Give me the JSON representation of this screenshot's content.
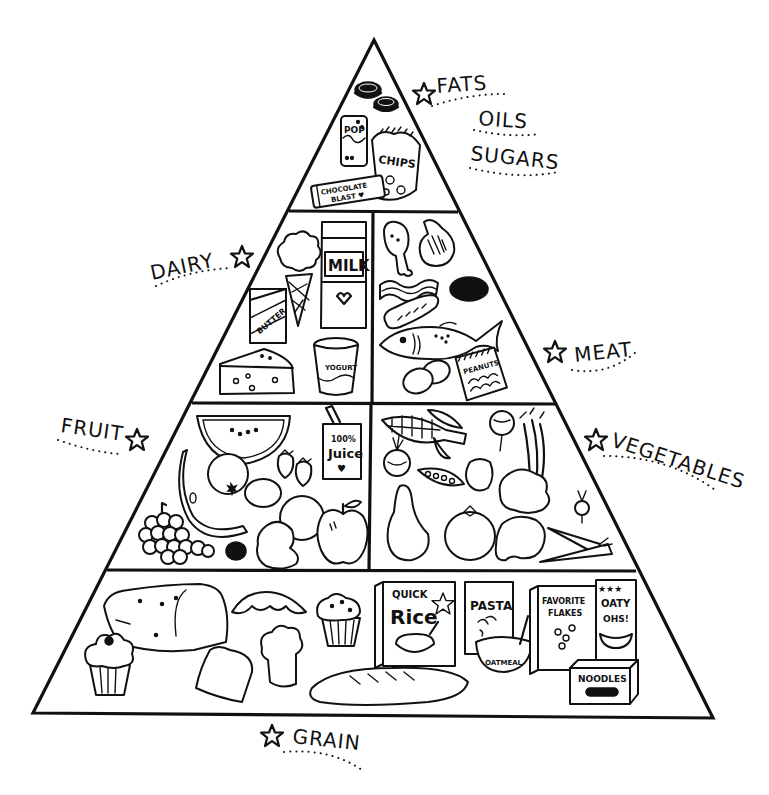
{
  "diagram": {
    "type": "food-pyramid",
    "style": "black-and-white line drawing",
    "colors": {
      "ink": "#111111",
      "background": "#ffffff"
    },
    "tiers": [
      {
        "level": 1,
        "label": "FATS, OILS, SUGARS",
        "label_lines": [
          "FATS",
          "OILS",
          "SUGARS"
        ],
        "label_side": "right",
        "foods": [
          "cookies",
          "pop can",
          "chips bag",
          "chocolate bar"
        ],
        "package_text": {
          "pop": "POP",
          "chips": "CHIPS",
          "chocolate_line1": "CHOCOLATE",
          "chocolate_line2": "BLAST ♥"
        }
      },
      {
        "level": 2,
        "sections": [
          {
            "label": "DAIRY",
            "label_side": "left",
            "foods": [
              "ice cream cone",
              "milk carton",
              "butter",
              "cheese",
              "yogurt"
            ],
            "package_text": {
              "milk": "MILK",
              "butter": "BUTTER",
              "yogurt": "YOGURT"
            }
          },
          {
            "label": "MEAT",
            "label_side": "right",
            "foods": [
              "chicken drumstick",
              "ham",
              "bacon",
              "hamburger patty",
              "sausage",
              "fish",
              "eggs",
              "peanuts"
            ],
            "package_text": {
              "peanuts": "PEANUTS"
            }
          }
        ]
      },
      {
        "level": 3,
        "sections": [
          {
            "label": "FRUIT",
            "label_side": "left",
            "foods": [
              "watermelon",
              "juice box",
              "strawberries",
              "orange",
              "lemon",
              "banana",
              "grapes",
              "blackberry",
              "pear",
              "orange",
              "apple"
            ],
            "package_text": {
              "juice_line1": "100%",
              "juice_line2": "Juice",
              "juice_line3": "♥"
            }
          },
          {
            "label": "VEGETABLES",
            "label_side": "right",
            "foods": [
              "corn",
              "onion",
              "beet",
              "peas",
              "pepper",
              "celery",
              "lettuce",
              "radish",
              "squash",
              "tomato",
              "potato",
              "carrots"
            ]
          }
        ]
      },
      {
        "level": 4,
        "label": "GRAIN",
        "label_side": "bottom",
        "foods": [
          "bread loaf",
          "cupcake",
          "croissant",
          "muffin",
          "toast",
          "roll",
          "baguette",
          "rice box",
          "pasta box",
          "oatmeal bowl",
          "cereal boxes",
          "noodles box"
        ],
        "package_text": {
          "rice_line1": "QUICK",
          "rice_line2": "Rice",
          "pasta": "PASTA",
          "oatmeal": "OATMEAL",
          "flakes_line1": "FAVORITE",
          "flakes_line2": "FLAKES",
          "oaty_stars": "★★★",
          "oaty_line1": "OATY",
          "oaty_line2": "OHS!",
          "noodles": "NOODLES"
        }
      }
    ],
    "labels": {
      "fats": "FATS",
      "oils": "OILS",
      "sugars": "SUGARS",
      "dairy": "DAIRY",
      "meat": "MEAT",
      "fruit": "FRUIT",
      "vegetables": "VEGETABLES",
      "grain": "GRAIN"
    },
    "icons": {
      "label_marker": "star-outline-icon"
    }
  }
}
